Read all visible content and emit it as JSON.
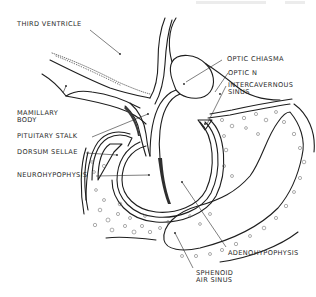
{
  "diagram": {
    "type": "anatomical-line-drawing",
    "colors": {
      "ink": "#1e1e1e",
      "label_text": "#2a2a2a",
      "background": "#ffffff",
      "bone_texture": "#6a6a6a"
    },
    "labels": {
      "third_ventricle": "THIRD VENTRICLE",
      "optic_chiasma": "OPTIC CHIASMA",
      "optic_n": "OPTIC N",
      "intercavernous_sinus_line1": "INTERCAVERNOUS",
      "intercavernous_sinus_line2": "SINUS",
      "mamillary_body_line1": "MAMILLARY",
      "mamillary_body_line2": "BODY",
      "pituitary_stalk": "PITUITARY STALK",
      "dorsum_sellae": "DORSUM SELLAE",
      "neurohypophysis": "NEUROHYPOPHYSIS",
      "adenohypophysis": "ADENOHYPOPHYSIS",
      "sphenoid_air_sinus_line1": "SPHENOID",
      "sphenoid_air_sinus_line2": "AIR SINUS"
    }
  }
}
